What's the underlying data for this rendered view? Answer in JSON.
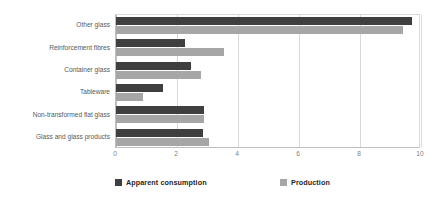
{
  "chart_data": {
    "type": "bar",
    "orientation": "horizontal",
    "title": "",
    "subtitle": "",
    "xlabel": "",
    "ylabel": "",
    "xlim": [
      0,
      10
    ],
    "xticks": [
      "0",
      "2",
      "4",
      "6",
      "8",
      "10"
    ],
    "xtick_values": [
      0,
      2,
      4,
      6,
      8,
      10
    ],
    "grid": true,
    "legend_position": "bottom",
    "categories": [
      "Other glass",
      "Reinforcement fibres",
      "Container glass",
      "Tableware",
      "Non-transformed flat glass",
      "Glass and glass products"
    ],
    "series": [
      {
        "name": "Apparent consumption",
        "color": "#3f3f3f",
        "values": [
          9.7,
          2.25,
          2.45,
          1.55,
          2.9,
          2.85
        ]
      },
      {
        "name": "Production",
        "color": "#a6a6a6",
        "values": [
          9.4,
          3.55,
          2.8,
          0.9,
          2.9,
          3.05
        ]
      }
    ]
  },
  "legend": {
    "entries": [
      {
        "label": "Apparent consumption",
        "color": "#3f3f3f"
      },
      {
        "label": "Production",
        "color": "#a6a6a6"
      }
    ]
  },
  "colors": {
    "apparent_consumption": "#3f3f3f",
    "production": "#a6a6a6",
    "gridline": "#d9d9d9",
    "axis": "#bfbfbf",
    "category_label": "#595959",
    "tick_label": "#808080",
    "plot_background": "#ffffff"
  }
}
